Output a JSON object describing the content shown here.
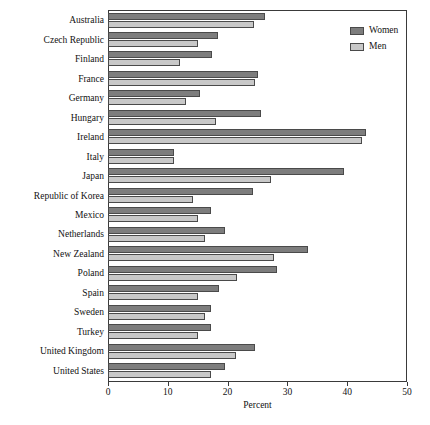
{
  "chart_data": {
    "type": "bar",
    "orientation": "horizontal",
    "title": "",
    "xlabel": "Percent",
    "ylabel": "",
    "xlim": [
      0,
      50
    ],
    "xticks": [
      0,
      10,
      20,
      30,
      40,
      50
    ],
    "grid": false,
    "legend_position": "top-right",
    "categories": [
      "Australia",
      "Czech Republic",
      "Finland",
      "France",
      "Germany",
      "Hungary",
      "Ireland",
      "Italy",
      "Japan",
      "Republic of Korea",
      "Mexico",
      "Netherlands",
      "New Zealand",
      "Poland",
      "Spain",
      "Sweden",
      "Turkey",
      "United Kingdom",
      "United States"
    ],
    "series": [
      {
        "name": "Women",
        "color": "#7d7d7d",
        "values": [
          26.3,
          18.4,
          17.4,
          25.1,
          15.4,
          25.6,
          43.1,
          11.0,
          39.5,
          24.2,
          17.2,
          19.6,
          33.4,
          28.3,
          18.6,
          17.2,
          17.2,
          24.6,
          19.6
        ]
      },
      {
        "name": "Men",
        "color": "#c8c8c8",
        "values": [
          24.4,
          15.1,
          12.0,
          24.6,
          13.0,
          18.1,
          42.5,
          11.0,
          27.3,
          14.2,
          15.1,
          16.2,
          27.8,
          21.6,
          15.1,
          16.2,
          15.1,
          21.4,
          17.2
        ]
      }
    ]
  },
  "legend": {
    "entries": [
      {
        "label": "Women"
      },
      {
        "label": "Men"
      }
    ]
  },
  "axis": {
    "x_title": "Percent",
    "x_tick_labels": [
      "0",
      "10",
      "20",
      "30",
      "40",
      "50"
    ]
  }
}
